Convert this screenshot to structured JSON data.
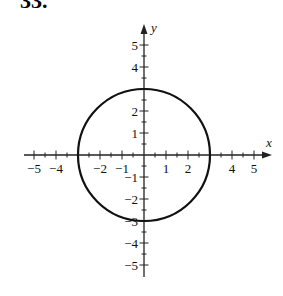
{
  "problem_label": "33.",
  "chart_data": {
    "type": "line",
    "title": "",
    "xlabel": "x",
    "ylabel": "y",
    "xlim": [
      -5.5,
      5.5
    ],
    "ylim": [
      -5.5,
      5.5
    ],
    "x_tick_labels": [
      "-5",
      "-4",
      "-2",
      "-1",
      "1",
      "2",
      "4",
      "5"
    ],
    "y_tick_labels": [
      "5",
      "4",
      "2",
      "1",
      "-1",
      "-2",
      "-3",
      "-4",
      "-5"
    ],
    "minor_tick_step": 0.5,
    "grid": false,
    "series": [
      {
        "name": "circle",
        "shape": "circle",
        "center": [
          0,
          0
        ],
        "radius": 3,
        "key_points": [
          [
            3,
            0
          ],
          [
            0,
            3
          ],
          [
            -3,
            0
          ],
          [
            0,
            -3
          ]
        ]
      }
    ]
  },
  "colors": {
    "curve": "#111111",
    "axes": "#222222",
    "background": "#ffffff"
  }
}
